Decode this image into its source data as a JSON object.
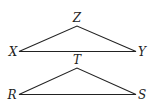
{
  "triangles": [
    {
      "name": "XYZ",
      "vertices": {
        "apex": "Z",
        "left": "X",
        "right": "Y"
      }
    },
    {
      "name": "RST",
      "vertices": {
        "apex": "T",
        "left": "R",
        "right": "S"
      }
    }
  ],
  "colors": {
    "stroke": "#222222",
    "background": "#ffffff"
  }
}
